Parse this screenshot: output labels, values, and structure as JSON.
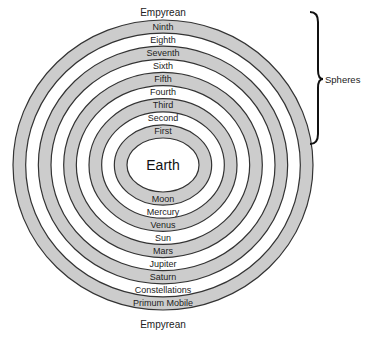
{
  "center_label": "Earth",
  "outer_label_top": "Empyrean",
  "outer_label_bottom": "Empyrean",
  "bracket_label": "Spheres",
  "colors": {
    "band_shaded": "#cccccc",
    "band_plain": "#ffffff",
    "outline": "#333333",
    "text": "#222222"
  },
  "rings": [
    {
      "order": 1,
      "top_label": "First",
      "bottom_label": "Moon",
      "shaded": true
    },
    {
      "order": 2,
      "top_label": "Second",
      "bottom_label": "Mercury",
      "shaded": false
    },
    {
      "order": 3,
      "top_label": "Third",
      "bottom_label": "Venus",
      "shaded": true
    },
    {
      "order": 4,
      "top_label": "Fourth",
      "bottom_label": "Sun",
      "shaded": false
    },
    {
      "order": 5,
      "top_label": "Fifth",
      "bottom_label": "Mars",
      "shaded": true
    },
    {
      "order": 6,
      "top_label": "Sixth",
      "bottom_label": "Jupiter",
      "shaded": false
    },
    {
      "order": 7,
      "top_label": "Seventh",
      "bottom_label": "Saturn",
      "shaded": true
    },
    {
      "order": 8,
      "top_label": "Eighth",
      "bottom_label": "Constellations",
      "shaded": false
    },
    {
      "order": 9,
      "top_label": "Ninth",
      "bottom_label": "Primum Mobile",
      "shaded": true
    }
  ]
}
